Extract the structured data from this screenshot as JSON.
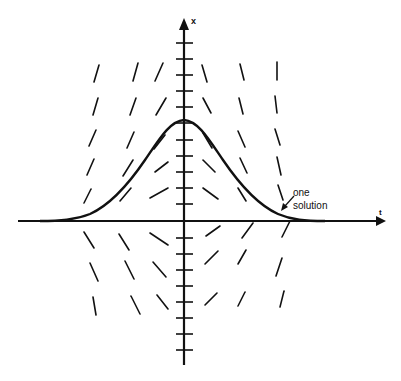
{
  "diagram": {
    "type": "slope-field",
    "axes": {
      "horizontal_label": "t",
      "vertical_label": "x"
    },
    "annotation": {
      "line1": "one",
      "line2": "solution"
    },
    "colors": {
      "ink": "#111111",
      "background": "#ffffff"
    },
    "vertical_tick_count": 21,
    "curve": "bell-shaped solution curve peaking on the x-axis, tending to 0 as t goes to ±infinity",
    "slope_field": {
      "left_columns_above": "positive slopes (rising), steepening away from the x-axis",
      "right_columns_above": "negative slopes (falling), steepening away from the x-axis",
      "left_columns_below": "negative slopes",
      "right_columns_below": "positive slopes"
    }
  }
}
